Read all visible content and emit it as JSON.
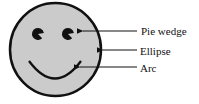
{
  "diagram": {
    "face": {
      "cx": 55.5,
      "cy": 49.5,
      "rx": 45.5,
      "ry": 46.5,
      "fill": "#cbcbcb",
      "stroke": "#111111"
    },
    "labels": {
      "pie_wedge": "Pie wedge",
      "ellipse": "Ellipse",
      "arc": "Arc"
    },
    "colors": {
      "line": "#111111",
      "text": "#111111"
    }
  }
}
